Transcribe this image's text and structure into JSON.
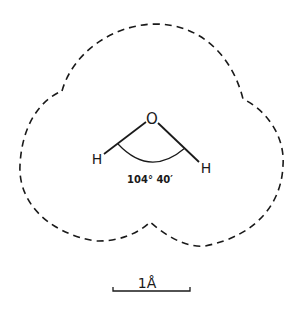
{
  "diagram": {
    "type": "molecule-outline",
    "molecule": "water",
    "atoms": {
      "oxygen": "O",
      "hydrogen_left": "H",
      "hydrogen_right": "H"
    },
    "bond_angle_label": "104° 40′",
    "outline_style": "dashed van der Waals boundary",
    "scale_bar": {
      "label": "1Å"
    },
    "colors": {
      "ink": "#1a1a1a",
      "background": "#ffffff"
    }
  }
}
